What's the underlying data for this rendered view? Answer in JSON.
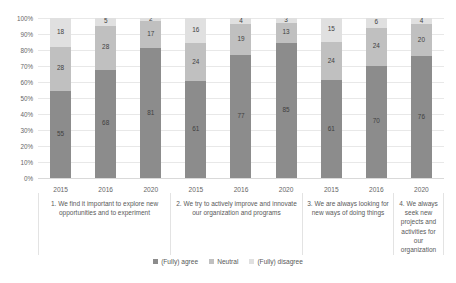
{
  "chart_data": {
    "type": "bar",
    "subtype": "100% stacked column",
    "title": "",
    "xlabel": "",
    "ylabel": "",
    "ylim": [
      0,
      100
    ],
    "ytick_labels": [
      "100%",
      "90%",
      "80%",
      "70%",
      "60%",
      "50%",
      "40%",
      "30%",
      "20%",
      "10%",
      "0%"
    ],
    "grid": true,
    "legend_position": "bottom",
    "legend": [
      "(Fully) agree",
      "Neutral",
      "(Fully) disagree"
    ],
    "colors": {
      "agree": "#8c8c8c",
      "neutral": "#c0c0c0",
      "disagree": "#e0e0e0"
    },
    "groups": [
      {
        "caption": "1. We find it important to explore new opportunities and to experiment",
        "bars": [
          {
            "year": "2015",
            "agree": 55,
            "neutral": 28,
            "disagree": 18
          },
          {
            "year": "2016",
            "agree": 68,
            "neutral": 28,
            "disagree": 5
          },
          {
            "year": "2020",
            "agree": 81,
            "neutral": 17,
            "disagree": 2
          }
        ]
      },
      {
        "caption": "2. We try to actively improve and innovate our organization and programs",
        "bars": [
          {
            "year": "2015",
            "agree": 61,
            "neutral": 24,
            "disagree": 16
          },
          {
            "year": "2016",
            "agree": 77,
            "neutral": 19,
            "disagree": 4
          },
          {
            "year": "2020",
            "agree": 85,
            "neutral": 13,
            "disagree": 3
          }
        ]
      },
      {
        "caption": "3. We are always looking for new ways of doing things",
        "bars": [
          {
            "year": "2015",
            "agree": 61,
            "neutral": 24,
            "disagree": 15
          },
          {
            "year": "2016",
            "agree": 70,
            "neutral": 24,
            "disagree": 6
          }
        ]
      },
      {
        "caption": "4. We always seek new projects and activities for our organization",
        "bars": [
          {
            "year": "2020",
            "agree": 76,
            "neutral": 20,
            "disagree": 4
          }
        ]
      }
    ]
  }
}
